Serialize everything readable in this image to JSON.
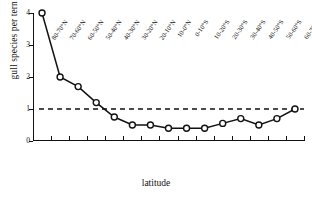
{
  "chart_data": {
    "type": "line",
    "title": "",
    "xlabel": "latitude",
    "ylabel": "gull species per tern species",
    "ylim": [
      0,
      4
    ],
    "yticks": [
      0,
      1,
      2,
      3,
      4
    ],
    "grid": false,
    "legend": "none",
    "categories": [
      "80-70°N",
      "70-60°N",
      "60-50°N",
      "50-40°N",
      "40-30°N",
      "30-20°N",
      "20-10°N",
      "10-0°N",
      "0-10°S",
      "10-20°S",
      "20-30°S",
      "30-40°S",
      "40-50°S",
      "50-60°S",
      "60-70°S"
    ],
    "values": [
      4.0,
      2.0,
      1.7,
      1.2,
      0.75,
      0.5,
      0.5,
      0.4,
      0.4,
      0.4,
      0.55,
      0.7,
      0.5,
      0.7,
      1.0
    ],
    "annotations": [
      {
        "name": "reference-line",
        "type": "horizontal-dashed",
        "y": 1.0
      }
    ],
    "marker": "open-circle",
    "line_color": "#111111"
  }
}
